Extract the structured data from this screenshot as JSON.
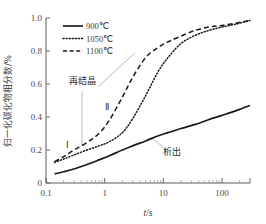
{
  "chart_data": {
    "type": "line",
    "title": "",
    "xlabel": "t/s",
    "ylabel": "归一化碳化物相分数/%",
    "xscale": "log",
    "xlim": [
      0.1,
      300
    ],
    "ylim": [
      0,
      1.0
    ],
    "xticks": [
      "0.1",
      "1",
      "10",
      "100"
    ],
    "xtick_values": [
      0.1,
      1,
      10,
      100
    ],
    "yticks": [
      "0",
      "0.2",
      "0.4",
      "0.6",
      "0.8",
      "1.0"
    ],
    "ytick_values": [
      0,
      0.2,
      0.4,
      0.6,
      0.8,
      1.0
    ],
    "grid": false,
    "legend_position": "top-left",
    "series": [
      {
        "name": "900℃",
        "style": "solid",
        "color": "#1a1a1a",
        "x": [
          0.14,
          0.2,
          0.3,
          0.5,
          0.8,
          1.2,
          2,
          3,
          5,
          8,
          12,
          20,
          35,
          60,
          100,
          180,
          300
        ],
        "y": [
          0.055,
          0.068,
          0.085,
          0.112,
          0.14,
          0.165,
          0.2,
          0.225,
          0.255,
          0.285,
          0.305,
          0.33,
          0.355,
          0.385,
          0.41,
          0.44,
          0.47
        ]
      },
      {
        "name": "1050℃",
        "style": "dotted",
        "color": "#1a1a1a",
        "x": [
          0.14,
          0.2,
          0.3,
          0.5,
          0.8,
          1.2,
          2,
          3,
          5,
          8,
          12,
          20,
          35,
          60,
          100,
          180,
          300
        ],
        "y": [
          0.125,
          0.145,
          0.17,
          0.2,
          0.225,
          0.25,
          0.305,
          0.39,
          0.53,
          0.67,
          0.76,
          0.845,
          0.895,
          0.925,
          0.945,
          0.965,
          0.985
        ]
      },
      {
        "name": "1100℃",
        "style": "dashed",
        "color": "#1a1a1a",
        "x": [
          0.14,
          0.2,
          0.3,
          0.5,
          0.8,
          1.2,
          2,
          3,
          5,
          8,
          12,
          20,
          35,
          60,
          100,
          180,
          300
        ],
        "y": [
          0.13,
          0.16,
          0.2,
          0.245,
          0.3,
          0.38,
          0.52,
          0.64,
          0.76,
          0.82,
          0.855,
          0.89,
          0.925,
          0.945,
          0.955,
          0.97,
          0.985
        ]
      }
    ],
    "annotations": [
      {
        "name": "recrystallization",
        "text": "再结晶",
        "x": 0.42,
        "y": 0.6
      },
      {
        "name": "stage-one",
        "text": "Ⅰ",
        "x": 0.23,
        "y": 0.21
      },
      {
        "name": "stage-two",
        "text": "Ⅱ",
        "x": 1.1,
        "y": 0.44
      },
      {
        "name": "precipitation",
        "text": "析出",
        "x": 14,
        "y": 0.17
      }
    ]
  },
  "legend": {
    "items": [
      {
        "label": "900℃",
        "style": "solid"
      },
      {
        "label": "1050℃",
        "style": "dotted"
      },
      {
        "label": "1100℃",
        "style": "dashed"
      }
    ]
  }
}
